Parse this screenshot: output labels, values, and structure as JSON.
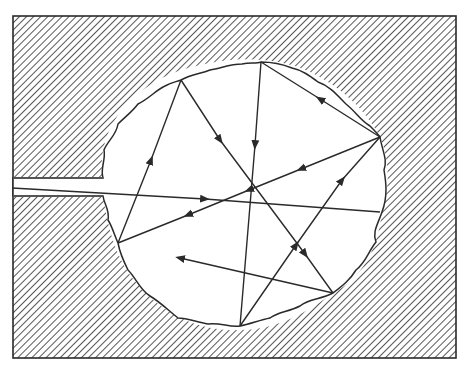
{
  "diagram": {
    "colors": {
      "ink": "#2a2a2a",
      "background": "#ffffff",
      "hatch": "#3a3a3a"
    },
    "frame": {
      "x": 13,
      "y": 16,
      "width": 443,
      "height": 342
    },
    "entrance_channel": {
      "top_y": 178,
      "bottom_y": 196,
      "end_x": 103
    },
    "reflection_points": [
      {
        "id": "G",
        "x": 380,
        "y": 212
      },
      {
        "id": "A",
        "x": 380,
        "y": 137
      },
      {
        "id": "B",
        "x": 261,
        "y": 62
      },
      {
        "id": "E",
        "x": 240,
        "y": 326
      },
      {
        "id": "D",
        "x": 118,
        "y": 243
      },
      {
        "id": "C",
        "x": 181,
        "y": 80
      },
      {
        "id": "F",
        "x": 333,
        "y": 293
      }
    ],
    "rays": [
      {
        "from": "entrance",
        "to": "G"
      },
      {
        "from": "G",
        "to": "A"
      },
      {
        "from": "A",
        "to": "B"
      },
      {
        "from": "B",
        "to": "E"
      },
      {
        "from": "E",
        "to": "A"
      },
      {
        "from": "A",
        "to": "D"
      },
      {
        "from": "D",
        "to": "C"
      },
      {
        "from": "C",
        "to": "F"
      },
      {
        "from": "F",
        "to": "end"
      }
    ],
    "ray_end": {
      "x": 180,
      "y": 258
    }
  }
}
